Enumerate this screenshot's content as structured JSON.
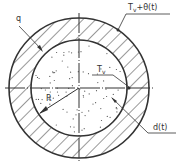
{
  "diagram": {
    "title": "",
    "labels": {
      "surface_temp": "T",
      "surface_temp_sub": "v",
      "surface_temp_suffix": "+θ(t)",
      "heat_flux": "q",
      "core_temp": "T",
      "core_temp_sub": "v",
      "radius": "R",
      "thickness": "d(t)"
    },
    "colors": {
      "stroke": "#333333",
      "background": "#ffffff",
      "dots": "#555555"
    }
  }
}
